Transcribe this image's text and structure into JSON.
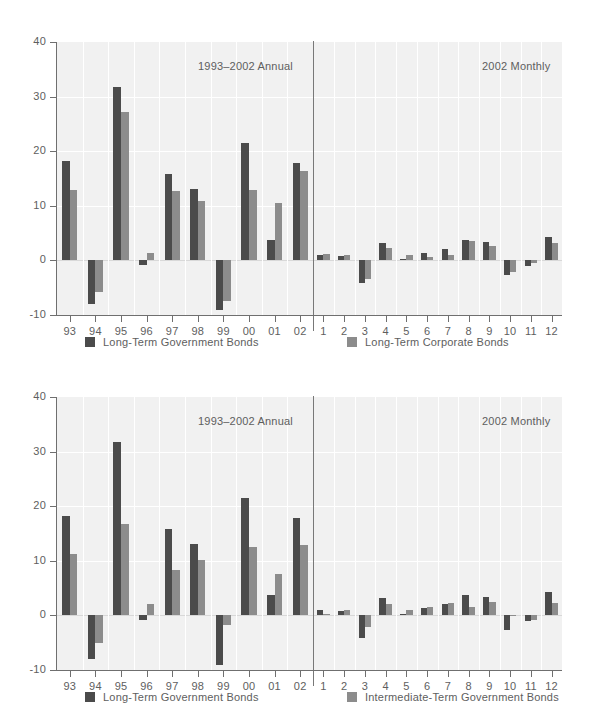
{
  "colors": {
    "series1": "#4b4b4b",
    "series2": "#8c8c8c",
    "plot_bg": "#f1f1f1",
    "grid": "#ffffff",
    "axis": "#6f6f6f",
    "text": "#5e5e5e"
  },
  "panels": [
    {
      "id": "panel-top",
      "left_caption": "1993–2002 Annual",
      "right_caption": "2002 Monthly",
      "legend": [
        {
          "label": "Long-Term Government Bonds",
          "color": "#4b4b4b"
        },
        {
          "label": "Long-Term Corporate Bonds",
          "color": "#8c8c8c"
        }
      ]
    },
    {
      "id": "panel-bottom",
      "left_caption": "1993–2002 Annual",
      "right_caption": "2002 Monthly",
      "legend": [
        {
          "label": "Long-Term Government Bonds",
          "color": "#4b4b4b"
        },
        {
          "label": "Intermediate-Term Government Bonds",
          "color": "#8c8c8c"
        }
      ]
    }
  ],
  "axis": {
    "yticks": [
      40,
      30,
      20,
      10,
      0,
      -10
    ],
    "ylim": [
      -10,
      40
    ],
    "annual_ticks": [
      "93",
      "94",
      "95",
      "96",
      "97",
      "98",
      "99",
      "00",
      "01",
      "02"
    ],
    "monthly_ticks": [
      "1",
      "2",
      "3",
      "4",
      "5",
      "6",
      "7",
      "8",
      "9",
      "10",
      "11",
      "12"
    ]
  },
  "chart_data": [
    {
      "type": "bar",
      "title": "Long-Term Government Bonds vs. Long-Term Corporate Bonds",
      "subtitle": "1993–2002 Annual / 2002 Monthly",
      "xlabel": "",
      "ylabel": "",
      "ylim": [
        -10,
        40
      ],
      "grid": true,
      "legend_position": "below",
      "annual": {
        "categories": [
          "93",
          "94",
          "95",
          "96",
          "97",
          "98",
          "99",
          "00",
          "01",
          "02"
        ],
        "series": [
          {
            "name": "Long-Term Government Bonds",
            "color": "#4b4b4b",
            "values": [
              18.2,
              -8.0,
              31.7,
              -0.9,
              15.8,
              13.1,
              -9.0,
              21.5,
              3.7,
              17.8
            ]
          },
          {
            "name": "Long-Term Corporate Bonds",
            "color": "#8c8c8c",
            "values": [
              12.9,
              -5.8,
              27.2,
              1.4,
              12.8,
              10.8,
              -7.4,
              12.9,
              10.6,
              16.3
            ]
          }
        ]
      },
      "monthly": {
        "categories": [
          "1",
          "2",
          "3",
          "4",
          "5",
          "6",
          "7",
          "8",
          "9",
          "10",
          "11",
          "12"
        ],
        "series": [
          {
            "name": "Long-Term Government Bonds",
            "color": "#4b4b4b",
            "values": [
              0.9,
              0.8,
              -4.2,
              3.1,
              0.2,
              1.4,
              2.1,
              3.7,
              3.4,
              -2.6,
              -1.1,
              4.3
            ]
          },
          {
            "name": "Long-Term Corporate Bonds",
            "color": "#8c8c8c",
            "values": [
              1.2,
              0.9,
              -3.4,
              2.3,
              0.9,
              0.6,
              0.9,
              3.6,
              2.7,
              -2.2,
              -0.5,
              3.1
            ]
          }
        ]
      }
    },
    {
      "type": "bar",
      "title": "Long-Term Government Bonds vs. Intermediate-Term Government Bonds",
      "subtitle": "1993–2002 Annual / 2002 Monthly",
      "xlabel": "",
      "ylabel": "",
      "ylim": [
        -10,
        40
      ],
      "grid": true,
      "legend_position": "below",
      "annual": {
        "categories": [
          "93",
          "94",
          "95",
          "96",
          "97",
          "98",
          "99",
          "00",
          "01",
          "02"
        ],
        "series": [
          {
            "name": "Long-Term Government Bonds",
            "color": "#4b4b4b",
            "values": [
              18.2,
              -8.0,
              31.7,
              -0.9,
              15.8,
              13.1,
              -9.0,
              21.5,
              3.7,
              17.8
            ]
          },
          {
            "name": "Intermediate-Term Government Bonds",
            "color": "#8c8c8c",
            "values": [
              11.2,
              -5.1,
              16.8,
              2.1,
              8.4,
              10.2,
              -1.8,
              12.6,
              7.6,
              12.9
            ]
          }
        ]
      },
      "monthly": {
        "categories": [
          "1",
          "2",
          "3",
          "4",
          "5",
          "6",
          "7",
          "8",
          "9",
          "10",
          "11",
          "12"
        ],
        "series": [
          {
            "name": "Long-Term Government Bonds",
            "color": "#4b4b4b",
            "values": [
              0.9,
              0.8,
              -4.2,
              3.1,
              0.2,
              1.4,
              2.1,
              3.7,
              3.4,
              -2.6,
              -1.1,
              4.3
            ]
          },
          {
            "name": "Intermediate-Term Government Bonds",
            "color": "#8c8c8c",
            "values": [
              0.2,
              0.9,
              -2.1,
              2.1,
              1.0,
              1.5,
              2.3,
              1.5,
              2.5,
              0.1,
              -0.8,
              2.3
            ]
          }
        ]
      }
    }
  ]
}
